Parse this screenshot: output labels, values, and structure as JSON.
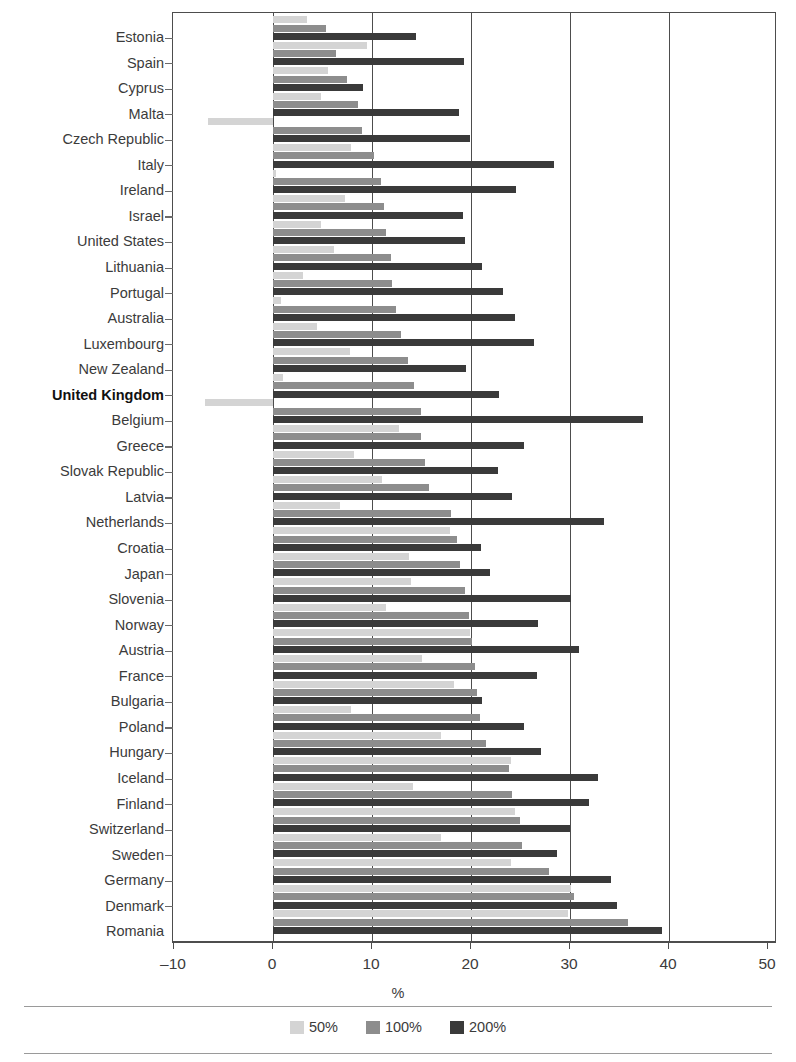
{
  "chart_data": {
    "type": "bar",
    "orientation": "horizontal",
    "title": "",
    "xlabel": "%",
    "ylabel": "",
    "xlim": [
      -10,
      50
    ],
    "xticks": [
      -10,
      0,
      10,
      20,
      30,
      40,
      50
    ],
    "xticklabels": [
      "–10",
      "0",
      "10",
      "20",
      "30",
      "40",
      "50"
    ],
    "grid": "vertical",
    "legend_position": "bottom-center",
    "highlight_category": "United Kingdom",
    "colors": {
      "50%": "#d4d4d4",
      "100%": "#8d8d8d",
      "200%": "#3a3a3a"
    },
    "categories": [
      "Estonia",
      "Spain",
      "Cyprus",
      "Malta",
      "Czech Republic",
      "Italy",
      "Ireland",
      "Israel",
      "United States",
      "Lithuania",
      "Portugal",
      "Australia",
      "Luxembourg",
      "New Zealand",
      "United Kingdom",
      "Belgium",
      "Greece",
      "Slovak Republic",
      "Latvia",
      "Netherlands",
      "Croatia",
      "Japan",
      "Slovenia",
      "Norway",
      "Austria",
      "France",
      "Bulgaria",
      "Poland",
      "Hungary",
      "Iceland",
      "Finland",
      "Switzerland",
      "Sweden",
      "Germany",
      "Denmark",
      "Romania"
    ],
    "series": [
      {
        "name": "50%",
        "color": "#d4d4d4",
        "values": [
          3.4,
          9.5,
          5.6,
          4.8,
          -6.6,
          7.9,
          0.3,
          7.3,
          4.8,
          6.2,
          3.0,
          0.8,
          4.4,
          7.8,
          1.0,
          -6.9,
          12.7,
          8.2,
          11.0,
          6.8,
          17.9,
          13.7,
          13.9,
          11.4,
          19.9,
          15.0,
          18.3,
          7.9,
          17.0,
          24.0,
          14.1,
          24.4,
          17.0,
          24.0,
          30.1,
          29.8
        ]
      },
      {
        "name": "100%",
        "color": "#8d8d8d",
        "values": [
          5.4,
          6.4,
          7.5,
          8.6,
          9.0,
          10.2,
          10.9,
          11.2,
          11.4,
          11.9,
          12.0,
          12.4,
          12.9,
          13.6,
          14.2,
          14.9,
          14.9,
          15.4,
          15.8,
          18.0,
          18.6,
          18.9,
          19.4,
          19.8,
          20.1,
          20.4,
          20.6,
          20.9,
          21.5,
          23.8,
          24.1,
          24.9,
          25.2,
          27.9,
          30.4,
          35.9
        ]
      },
      {
        "name": "200%",
        "color": "#3a3a3a",
        "values": [
          14.4,
          19.3,
          9.1,
          18.8,
          19.9,
          28.4,
          24.5,
          19.2,
          19.4,
          21.1,
          23.2,
          24.4,
          26.4,
          19.5,
          22.8,
          37.4,
          25.4,
          22.7,
          24.1,
          33.4,
          21.0,
          21.9,
          30.1,
          26.8,
          30.9,
          26.7,
          21.1,
          25.4,
          27.1,
          32.8,
          31.9,
          30.0,
          28.7,
          34.1,
          34.7,
          39.3
        ]
      }
    ]
  },
  "legend": {
    "items": [
      {
        "label": "50%",
        "color": "#d4d4d4"
      },
      {
        "label": "100%",
        "color": "#8d8d8d"
      },
      {
        "label": "200%",
        "color": "#3a3a3a"
      }
    ]
  },
  "axis": {
    "x_title": "%"
  }
}
